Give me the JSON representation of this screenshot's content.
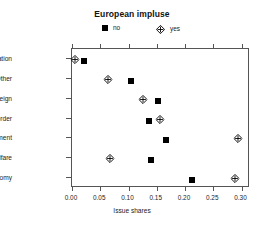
{
  "chart_data": {
    "type": "scatter",
    "title": "European impluse",
    "xlabel": "Issue shares",
    "ylabel": "",
    "xlim": [
      0.0,
      0.315
    ],
    "xticks": [
      0.0,
      0.05,
      0.1,
      0.15,
      0.2,
      0.25,
      0.3
    ],
    "xtick_labels": [
      "0.00",
      "0.05",
      "0.10",
      "0.15",
      "0.20",
      "0.25",
      "0.30"
    ],
    "grid": false,
    "legend_position": "top-center",
    "categories": [
      "Reunification",
      "Other",
      "Foreign",
      "Law and order",
      "Environment",
      "Welfare",
      "Economy"
    ],
    "series": [
      {
        "name": "no",
        "marker": "filled-square",
        "color": "#000000",
        "values": [
          0.022,
          0.105,
          0.152,
          0.137,
          0.166,
          0.14,
          0.213
        ]
      },
      {
        "name": "yes",
        "marker": "crossed-diamond",
        "color": "#000000",
        "values": [
          0.005,
          0.063,
          0.125,
          0.155,
          0.293,
          0.068,
          0.288
        ]
      }
    ]
  },
  "legend": {
    "entries": [
      {
        "label": "no",
        "marker": "filled-square"
      },
      {
        "label": "yes",
        "marker": "crossed-diamond"
      }
    ]
  }
}
